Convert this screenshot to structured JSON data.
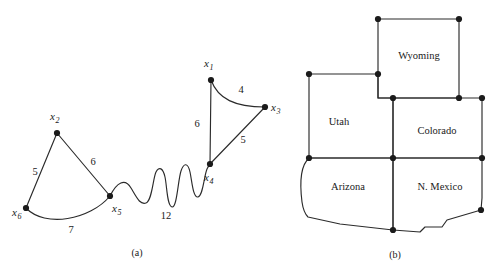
{
  "figure": {
    "panels": [
      {
        "id": "a",
        "caption": "(a)",
        "type": "weighted-graph",
        "vertices": [
          {
            "id": "x1",
            "base": "x",
            "sub": "1",
            "x": 211,
            "y": 80,
            "label_x": 204,
            "label_y": 67
          },
          {
            "id": "x2",
            "base": "x",
            "sub": "2",
            "x": 57,
            "y": 133,
            "label_x": 50,
            "label_y": 120
          },
          {
            "id": "x3",
            "base": "x",
            "sub": "3",
            "x": 265,
            "y": 107,
            "label_x": 271,
            "label_y": 111
          },
          {
            "id": "x4",
            "base": "x",
            "sub": "4",
            "x": 210,
            "y": 164,
            "label_x": 204,
            "label_y": 181
          },
          {
            "id": "x5",
            "base": "x",
            "sub": "5",
            "x": 110,
            "y": 196,
            "label_x": 112,
            "label_y": 212
          },
          {
            "id": "x6",
            "base": "x",
            "sub": "6",
            "x": 26,
            "y": 208,
            "label_x": 12,
            "label_y": 216
          }
        ],
        "edges": [
          {
            "from": "x2",
            "to": "x6",
            "weight": "5",
            "label_x": 35,
            "label_y": 175
          },
          {
            "from": "x2",
            "to": "x5",
            "weight": "6",
            "label_x": 93,
            "label_y": 165
          },
          {
            "from": "x6",
            "to": "x5",
            "weight": "7",
            "label_x": 71,
            "label_y": 233
          },
          {
            "from": "x5",
            "to": "x4",
            "weight": "12",
            "label_x": 166,
            "label_y": 219
          },
          {
            "from": "x1",
            "to": "x4",
            "weight": "6",
            "label_x": 197,
            "label_y": 127
          },
          {
            "from": "x1",
            "to": "x3",
            "weight": "4",
            "label_x": 241,
            "label_y": 93
          },
          {
            "from": "x3",
            "to": "x4",
            "weight": "5",
            "label_x": 243,
            "label_y": 143
          }
        ]
      },
      {
        "id": "b",
        "caption": "(b)",
        "type": "state-map",
        "regions": [
          {
            "name": "Wyoming",
            "label_x": 419,
            "label_y": 59
          },
          {
            "name": "Utah",
            "label_x": 339,
            "label_y": 125
          },
          {
            "name": "Colorado",
            "label_x": 437,
            "label_y": 134
          },
          {
            "name": "Arizona",
            "label_x": 348,
            "label_y": 190
          },
          {
            "name": "N. Mexico",
            "label_x": 440,
            "label_y": 190
          }
        ],
        "corner_nodes": [
          {
            "x": 378,
            "y": 19
          },
          {
            "x": 459,
            "y": 19
          },
          {
            "x": 309,
            "y": 74
          },
          {
            "x": 378,
            "y": 74
          },
          {
            "x": 393,
            "y": 98
          },
          {
            "x": 459,
            "y": 98
          },
          {
            "x": 482,
            "y": 98
          },
          {
            "x": 309,
            "y": 158
          },
          {
            "x": 393,
            "y": 158
          },
          {
            "x": 482,
            "y": 158
          },
          {
            "x": 481,
            "y": 210
          },
          {
            "x": 393,
            "y": 230
          }
        ]
      }
    ]
  },
  "colors": {
    "stroke": "#2b2b2b",
    "node": "#1b1b1b",
    "text": "#1a1a1a",
    "background": "#ffffff"
  }
}
